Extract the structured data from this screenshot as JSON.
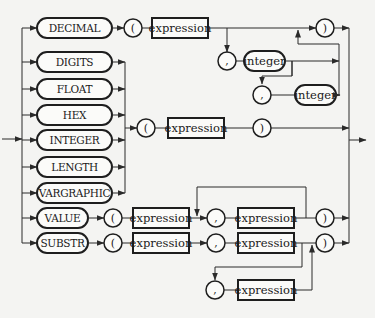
{
  "diagram": {
    "type": "railroad-syntax-diagram",
    "keywords": {
      "decimal": "DECIMAL",
      "digits": "DIGITS",
      "float": "FLOAT",
      "hex": "HEX",
      "integer": "INTEGER",
      "length": "LENGTH",
      "vargraphic": "VARGRAPHIC",
      "value": "VALUE",
      "substr": "SUBSTR"
    },
    "nonterminals": {
      "expression": "expression",
      "integer": "integer"
    },
    "symbols": {
      "open_paren": "(",
      "close_paren": ")",
      "comma": ","
    }
  }
}
